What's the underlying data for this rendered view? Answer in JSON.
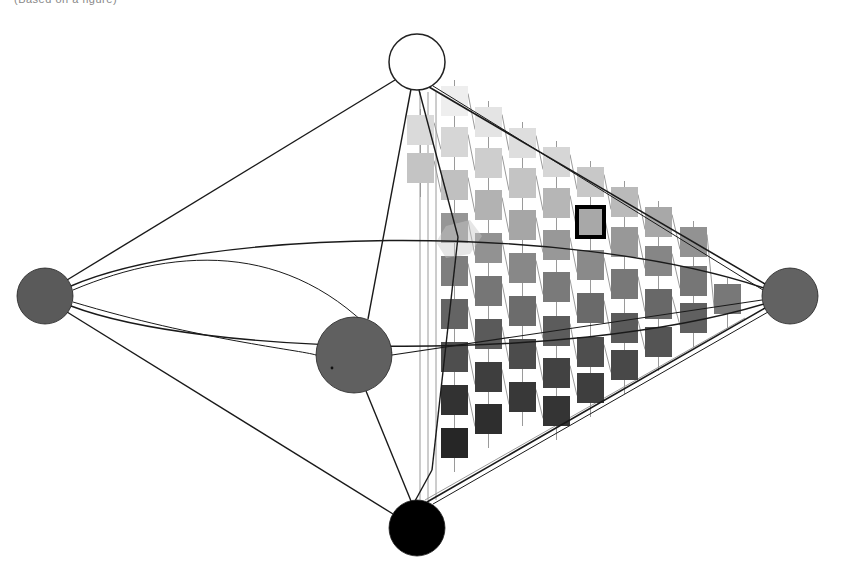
{
  "caption": "(Based on a figure)",
  "colors": {
    "line": "#1a1a1a",
    "lattice": "#9a9a9a",
    "node_white": "#ffffff",
    "node_black": "#000000",
    "node_grey": "#5e5e5e",
    "highlight_border": "#000000"
  },
  "nodes": [
    {
      "id": "top-white",
      "cx": 417,
      "cy": 62,
      "r": 28,
      "fill": "#ffffff"
    },
    {
      "id": "left-grey",
      "cx": 45,
      "cy": 296,
      "r": 28,
      "fill": "#5a5a5a"
    },
    {
      "id": "center-grey",
      "cx": 354,
      "cy": 355,
      "r": 38,
      "fill": "#606060"
    },
    {
      "id": "right-grey",
      "cx": 790,
      "cy": 296,
      "r": 28,
      "fill": "#626262"
    },
    {
      "id": "bottom-black",
      "cx": 417,
      "cy": 528,
      "r": 28,
      "fill": "#000000"
    }
  ],
  "grid": {
    "square_w": 27,
    "square_h": 30,
    "columns": [
      {
        "x": 407,
        "squares": [
          {
            "y": 115,
            "g": 218
          },
          {
            "y": 153,
            "g": 196
          }
        ]
      },
      {
        "x": 441,
        "squares": [
          {
            "y": 86,
            "g": 238
          },
          {
            "y": 127,
            "g": 214
          },
          {
            "y": 170,
            "g": 192
          },
          {
            "y": 213,
            "g": 150
          },
          {
            "y": 256,
            "g": 126
          },
          {
            "y": 299,
            "g": 100
          },
          {
            "y": 342,
            "g": 78
          },
          {
            "y": 385,
            "g": 50
          },
          {
            "y": 428,
            "g": 38
          }
        ]
      },
      {
        "x": 475,
        "squares": [
          {
            "y": 107,
            "g": 228
          },
          {
            "y": 148,
            "g": 206
          },
          {
            "y": 190,
            "g": 178
          },
          {
            "y": 233,
            "g": 146
          },
          {
            "y": 276,
            "g": 118
          },
          {
            "y": 319,
            "g": 90
          },
          {
            "y": 362,
            "g": 62
          },
          {
            "y": 404,
            "g": 46
          }
        ]
      },
      {
        "x": 509,
        "squares": [
          {
            "y": 128,
            "g": 222
          },
          {
            "y": 168,
            "g": 196
          },
          {
            "y": 210,
            "g": 166
          },
          {
            "y": 253,
            "g": 136
          },
          {
            "y": 296,
            "g": 108
          },
          {
            "y": 339,
            "g": 76
          },
          {
            "y": 382,
            "g": 56
          }
        ]
      },
      {
        "x": 543,
        "squares": [
          {
            "y": 147,
            "g": 214
          },
          {
            "y": 188,
            "g": 182
          },
          {
            "y": 230,
            "g": 152
          },
          {
            "y": 272,
            "g": 122
          },
          {
            "y": 316,
            "g": 92
          },
          {
            "y": 358,
            "g": 66
          },
          {
            "y": 396,
            "g": 52
          }
        ]
      },
      {
        "x": 577,
        "squares": [
          {
            "y": 167,
            "g": 200
          },
          {
            "y": 207,
            "g": 168,
            "highlight": true
          },
          {
            "y": 250,
            "g": 138
          },
          {
            "y": 293,
            "g": 106
          },
          {
            "y": 337,
            "g": 78
          },
          {
            "y": 373,
            "g": 62
          }
        ]
      },
      {
        "x": 611,
        "squares": [
          {
            "y": 187,
            "g": 186
          },
          {
            "y": 227,
            "g": 152
          },
          {
            "y": 269,
            "g": 120
          },
          {
            "y": 313,
            "g": 90
          },
          {
            "y": 350,
            "g": 72
          }
        ]
      },
      {
        "x": 645,
        "squares": [
          {
            "y": 207,
            "g": 168
          },
          {
            "y": 246,
            "g": 134
          },
          {
            "y": 289,
            "g": 104
          },
          {
            "y": 327,
            "g": 84
          }
        ]
      },
      {
        "x": 680,
        "squares": [
          {
            "y": 227,
            "g": 146
          },
          {
            "y": 266,
            "g": 118
          },
          {
            "y": 303,
            "g": 96
          }
        ]
      },
      {
        "x": 714,
        "squares": [
          {
            "y": 284,
            "g": 120
          }
        ]
      }
    ]
  },
  "edges": [
    {
      "from": "top-white",
      "to": "left-grey"
    },
    {
      "from": "top-white",
      "to": "center-grey"
    },
    {
      "from": "top-white",
      "to": "right-grey"
    },
    {
      "from": "left-grey",
      "to": "bottom-black"
    },
    {
      "from": "center-grey",
      "to": "bottom-black"
    },
    {
      "from": "right-grey",
      "to": "bottom-black"
    }
  ]
}
